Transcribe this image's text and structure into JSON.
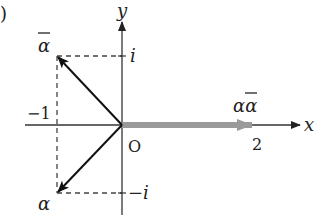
{
  "figure": {
    "corner_mark": ")",
    "axes": {
      "x_label": "x",
      "y_label": "y",
      "origin_label": "O"
    },
    "ticks": {
      "neg_one": "−1",
      "two": "2",
      "i": "i",
      "neg_i": "−i"
    },
    "points": {
      "alpha": "α",
      "alpha_bar": "α",
      "product": "αα"
    },
    "colors": {
      "axis": "#333333",
      "vector": "#1a1a1a",
      "dashed": "#444444",
      "product_vector": "#9a9a9a"
    }
  }
}
